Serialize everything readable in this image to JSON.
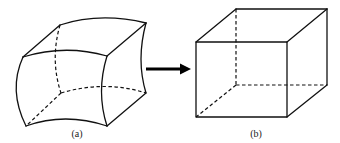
{
  "figure": {
    "colors": {
      "line": "#111111",
      "arrow": "#000000",
      "background": "#ffffff"
    },
    "panels": [
      {
        "id": "a",
        "label": "(a)",
        "shape": "curved-hexahedron",
        "visible_edges": 9,
        "hidden_edges": 3
      },
      {
        "id": "b",
        "label": "(b)",
        "shape": "cube",
        "visible_edges": 9,
        "hidden_edges": 3
      }
    ],
    "arrow": {
      "direction": "right",
      "from": "a",
      "to": "b"
    }
  }
}
